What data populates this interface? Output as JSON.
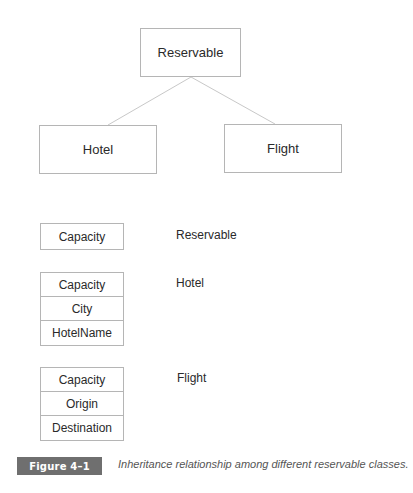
{
  "diagram": {
    "root": {
      "label": "Reservable"
    },
    "children": [
      {
        "label": "Hotel"
      },
      {
        "label": "Flight"
      }
    ],
    "edge_color": "#c8c8c8",
    "border_color": "#b5b5b5"
  },
  "field_layouts": [
    {
      "class": "Reservable",
      "fields": [
        "Capacity"
      ]
    },
    {
      "class": "Hotel",
      "fields": [
        "Capacity",
        "City",
        "HotelName"
      ]
    },
    {
      "class": "Flight",
      "fields": [
        "Capacity",
        "Origin",
        "Destination"
      ]
    }
  ],
  "figure": {
    "label": "Figure 4–1",
    "caption": "Inheritance relationship among different reservable classes.",
    "label_bg": "#6f6f6f"
  }
}
